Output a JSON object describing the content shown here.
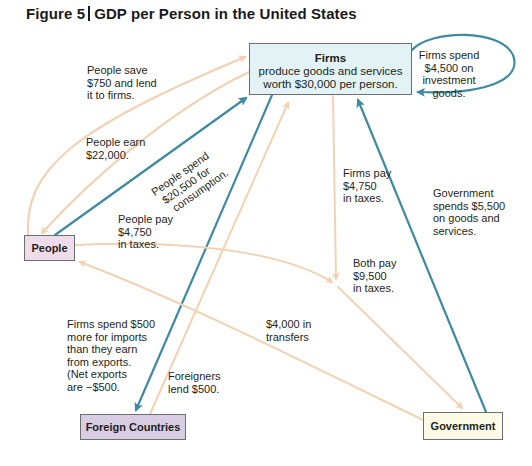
{
  "title": {
    "figure_label": "Figure 5",
    "text": "GDP per Person in the United States"
  },
  "nodes": {
    "firms": {
      "heading": "Firms",
      "line1": "produce goods and services",
      "line2": "worth $30,000 per person.",
      "fill": "#e2f2f5"
    },
    "people": {
      "label": "People",
      "fill": "#eedcea"
    },
    "foreign": {
      "label": "Foreign Countries",
      "fill": "#d8cde3"
    },
    "government": {
      "label": "Government",
      "fill": "#fdfbe6"
    }
  },
  "flows": {
    "save": [
      "People save",
      "$750 and lend",
      "it to firms."
    ],
    "earn": [
      "People earn",
      "$22,000."
    ],
    "spend": [
      "People spend",
      "$20,500 for",
      "consumption."
    ],
    "people_tax": [
      "People pay",
      "$4,750",
      "in taxes."
    ],
    "invest": [
      "Firms spend",
      "$4,500 on",
      "investment",
      "goods."
    ],
    "firms_tax": [
      "Firms pay",
      "$4,750",
      "in taxes."
    ],
    "gov_spend": [
      "Government",
      "spends $5,500",
      "on goods and",
      "services."
    ],
    "both_tax": [
      "Both pay",
      "$9,500",
      "in taxes."
    ],
    "transfers": [
      "$4,000 in",
      "transfers"
    ],
    "imports": [
      "Firms spend $500",
      "more for imports",
      "than they earn",
      "from exports.",
      "(Net exports",
      "are −$500."
    ],
    "foreign_lend": [
      "Foreigners",
      "lend $500."
    ]
  },
  "colors": {
    "money_arrow": "#f3d2b3",
    "goods_arrow": "#3e8aa3",
    "box_border": "#6d6e71"
  }
}
